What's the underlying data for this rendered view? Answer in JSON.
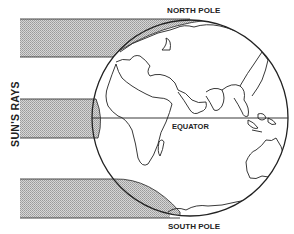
{
  "labels": {
    "north_pole": "NORTH POLE",
    "south_pole": "SOUTH POLE",
    "equator": "EQUATOR",
    "suns_rays": "SUN'S RAYS"
  },
  "diagram": {
    "globe": {
      "cx": 190,
      "cy": 118,
      "r": 98
    },
    "ray_bands": [
      {
        "name": "upper-ray-band",
        "y_top": 19,
        "y_bottom": 57
      },
      {
        "name": "middle-ray-band",
        "y_top": 99,
        "y_bottom": 138
      },
      {
        "name": "lower-ray-band",
        "y_top": 179,
        "y_bottom": 218
      }
    ],
    "equator_y": 118,
    "colors": {
      "line": "#222222",
      "shade": "#bdbdbd",
      "background": "#ffffff"
    }
  }
}
